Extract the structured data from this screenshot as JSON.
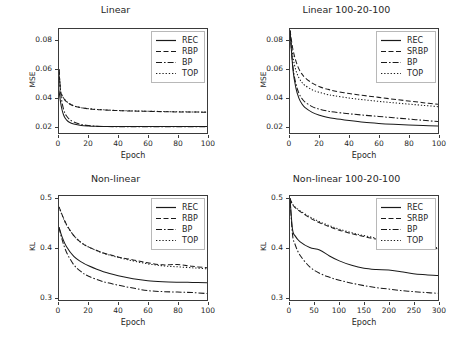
{
  "figure": {
    "background": "#ffffff",
    "line_color": "#1a1a1a",
    "axis_color": "#3a3a3a"
  },
  "panels": [
    {
      "id": "linear",
      "title": "Linear",
      "xlabel": "Epoch",
      "ylabel": "MSE",
      "xticks": [
        "0",
        "20",
        "40",
        "60",
        "80",
        "100"
      ],
      "yticks": [
        "0.02",
        "0.04",
        "0.06",
        "0.08"
      ],
      "legend": [
        "REC",
        "RBP",
        "BP",
        "TOP"
      ]
    },
    {
      "id": "linear-100-20-100",
      "title": "Linear 100-20-100",
      "xlabel": "Epoch",
      "ylabel": "MSE",
      "xticks": [
        "0",
        "20",
        "40",
        "60",
        "80",
        "100"
      ],
      "yticks": [
        "0.02",
        "0.04",
        "0.06",
        "0.08"
      ],
      "legend": [
        "REC",
        "SRBP",
        "BP",
        "TOP"
      ]
    },
    {
      "id": "non-linear",
      "title": "Non-linear",
      "xlabel": "Epoch",
      "ylabel": "KL",
      "xticks": [
        "0",
        "20",
        "40",
        "60",
        "80",
        "100"
      ],
      "yticks": [
        "0.3",
        "0.4",
        "0.5"
      ],
      "legend": [
        "REC",
        "RBP",
        "BP",
        "TOP"
      ]
    },
    {
      "id": "non-linear-100-20-100",
      "title": "Non-linear 100-20-100",
      "xlabel": "Epoch",
      "ylabel": "KL",
      "xticks": [
        "0",
        "50",
        "100",
        "150",
        "200",
        "250",
        "300"
      ],
      "yticks": [
        "0.3",
        "0.4",
        "0.5"
      ],
      "legend": [
        "REC",
        "SRBP",
        "BP",
        "TOP"
      ]
    }
  ],
  "chart_data": [
    {
      "type": "line",
      "title": "Linear",
      "xlabel": "Epoch",
      "ylabel": "MSE",
      "xlim": [
        0,
        100
      ],
      "ylim": [
        0.0155,
        0.0885
      ],
      "xticks": [
        0,
        20,
        40,
        60,
        80,
        100
      ],
      "yticks": [
        0.02,
        0.04,
        0.06,
        0.08
      ],
      "grid": false,
      "legend_position": "upper right",
      "x": [
        0,
        1,
        2,
        3,
        4,
        5,
        7,
        10,
        15,
        20,
        25,
        30,
        40,
        50,
        60,
        70,
        80,
        90,
        100
      ],
      "series": [
        {
          "name": "REC",
          "style": "solid",
          "values": [
            0.0455,
            0.0375,
            0.032,
            0.0285,
            0.0262,
            0.0248,
            0.023,
            0.0218,
            0.0208,
            0.0204,
            0.0202,
            0.0201,
            0.02,
            0.02,
            0.02,
            0.02,
            0.02,
            0.02,
            0.02
          ]
        },
        {
          "name": "RBP",
          "style": "dashed",
          "values": [
            0.06,
            0.0452,
            0.042,
            0.04,
            0.0387,
            0.0376,
            0.036,
            0.0345,
            0.0332,
            0.0325,
            0.032,
            0.0317,
            0.0312,
            0.0309,
            0.0307,
            0.0305,
            0.0303,
            0.0302,
            0.0301
          ]
        },
        {
          "name": "BP",
          "style": "dashdot",
          "values": [
            0.06,
            0.045,
            0.0372,
            0.0325,
            0.0295,
            0.0276,
            0.0252,
            0.0232,
            0.0215,
            0.0207,
            0.0203,
            0.0201,
            0.0199,
            0.0199,
            0.0199,
            0.0199,
            0.0199,
            0.0199,
            0.0199
          ]
        },
        {
          "name": "TOP",
          "style": "dotted",
          "values": [
            0.0602,
            0.0452,
            0.0421,
            0.0401,
            0.0388,
            0.0377,
            0.0361,
            0.0346,
            0.0333,
            0.0326,
            0.0321,
            0.0318,
            0.0313,
            0.031,
            0.0308,
            0.0306,
            0.0304,
            0.0303,
            0.0302
          ]
        }
      ]
    },
    {
      "type": "line",
      "title": "Linear 100-20-100",
      "xlabel": "Epoch",
      "ylabel": "MSE",
      "xlim": [
        0,
        100
      ],
      "ylim": [
        0.0155,
        0.0885
      ],
      "xticks": [
        0,
        20,
        40,
        60,
        80,
        100
      ],
      "yticks": [
        0.02,
        0.04,
        0.06,
        0.08
      ],
      "grid": false,
      "legend_position": "upper right",
      "x": [
        0,
        2,
        4,
        6,
        8,
        10,
        15,
        20,
        25,
        30,
        40,
        50,
        60,
        70,
        80,
        90,
        100
      ],
      "series": [
        {
          "name": "REC",
          "style": "solid",
          "values": [
            0.0875,
            0.06,
            0.047,
            0.04,
            0.036,
            0.0335,
            0.03,
            0.028,
            0.0266,
            0.0256,
            0.0242,
            0.023,
            0.0222,
            0.0216,
            0.0211,
            0.0207,
            0.0204
          ]
        },
        {
          "name": "SRBP",
          "style": "dashed",
          "values": [
            0.0875,
            0.074,
            0.066,
            0.0605,
            0.057,
            0.0545,
            0.0505,
            0.048,
            0.0463,
            0.045,
            0.0432,
            0.0418,
            0.0405,
            0.0392,
            0.038,
            0.0368,
            0.0356
          ]
        },
        {
          "name": "BP",
          "style": "dashdot",
          "values": [
            0.087,
            0.062,
            0.05,
            0.0435,
            0.0398,
            0.0374,
            0.034,
            0.0322,
            0.031,
            0.0302,
            0.029,
            0.028,
            0.0271,
            0.0262,
            0.0253,
            0.0244,
            0.0235
          ]
        },
        {
          "name": "TOP",
          "style": "dotted",
          "values": [
            0.0873,
            0.069,
            0.0595,
            0.0543,
            0.0511,
            0.049,
            0.0458,
            0.044,
            0.0426,
            0.0416,
            0.04,
            0.0388,
            0.0377,
            0.0367,
            0.0358,
            0.0349,
            0.034
          ]
        }
      ]
    },
    {
      "type": "line",
      "title": "Non-linear",
      "xlabel": "Epoch",
      "ylabel": "KL",
      "xlim": [
        0,
        100
      ],
      "ylim": [
        0.295,
        0.505
      ],
      "xticks": [
        0,
        20,
        40,
        60,
        80,
        100
      ],
      "yticks": [
        0.3,
        0.4,
        0.5
      ],
      "grid": false,
      "legend_position": "upper right",
      "x": [
        0,
        2,
        5,
        10,
        15,
        20,
        30,
        40,
        50,
        60,
        70,
        80,
        90,
        100
      ],
      "series": [
        {
          "name": "REC",
          "style": "solid",
          "values": [
            0.442,
            0.423,
            0.403,
            0.383,
            0.372,
            0.364,
            0.352,
            0.344,
            0.338,
            0.334,
            0.332,
            0.331,
            0.3305,
            0.33
          ]
        },
        {
          "name": "RBP",
          "style": "dashed",
          "values": [
            0.483,
            0.468,
            0.448,
            0.425,
            0.411,
            0.402,
            0.39,
            0.382,
            0.376,
            0.37,
            0.366,
            0.3665,
            0.363,
            0.36
          ]
        },
        {
          "name": "BP",
          "style": "dashdot",
          "values": [
            0.442,
            0.418,
            0.392,
            0.366,
            0.352,
            0.343,
            0.332,
            0.325,
            0.319,
            0.314,
            0.312,
            0.311,
            0.31,
            0.308
          ]
        },
        {
          "name": "TOP",
          "style": "dotted",
          "values": [
            0.483,
            0.467,
            0.447,
            0.425,
            0.411,
            0.402,
            0.3895,
            0.381,
            0.374,
            0.368,
            0.364,
            0.362,
            0.36,
            0.358
          ]
        }
      ]
    },
    {
      "type": "line",
      "title": "Non-linear 100-20-100",
      "xlabel": "Epoch",
      "ylabel": "KL",
      "xlim": [
        0,
        300
      ],
      "ylim": [
        0.295,
        0.505
      ],
      "xticks": [
        0,
        50,
        100,
        150,
        200,
        250,
        300
      ],
      "yticks": [
        0.3,
        0.4,
        0.5
      ],
      "grid": false,
      "legend_position": "upper right",
      "x": [
        0,
        5,
        10,
        20,
        40,
        60,
        80,
        100,
        125,
        150,
        175,
        200,
        225,
        250,
        275,
        300
      ],
      "series": [
        {
          "name": "REC",
          "style": "solid",
          "values": [
            0.5,
            0.438,
            0.425,
            0.413,
            0.401,
            0.396,
            0.384,
            0.374,
            0.365,
            0.359,
            0.3565,
            0.3555,
            0.352,
            0.348,
            0.346,
            0.3445
          ]
        },
        {
          "name": "SRBP",
          "style": "dashed",
          "values": [
            0.5,
            0.488,
            0.482,
            0.474,
            0.461,
            0.451,
            0.443,
            0.436,
            0.429,
            0.423,
            0.418,
            0.4135,
            0.409,
            0.405,
            0.4015,
            0.3985
          ]
        },
        {
          "name": "BP",
          "style": "dashdot",
          "values": [
            0.5,
            0.428,
            0.408,
            0.386,
            0.362,
            0.349,
            0.341,
            0.335,
            0.329,
            0.324,
            0.32,
            0.317,
            0.314,
            0.312,
            0.31,
            0.3085
          ]
        },
        {
          "name": "TOP",
          "style": "dotted",
          "values": [
            0.5,
            0.489,
            0.483,
            0.4755,
            0.463,
            0.453,
            0.445,
            0.438,
            0.431,
            0.425,
            0.42,
            0.4155,
            0.411,
            0.407,
            0.4035,
            0.4005
          ]
        }
      ]
    }
  ]
}
